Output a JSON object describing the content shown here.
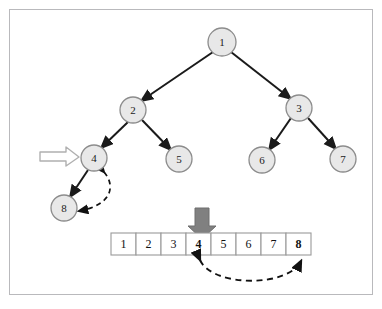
{
  "figure": {
    "background_color": "#ffffff",
    "frame_color": "#b9b9bc"
  },
  "colors": {
    "node_fill": "#e8e8e8",
    "node_stroke": "#8c8c8c",
    "node_text": "#1b1b1b",
    "edge": "#1a1a1a",
    "dashed_arrow": "#111111",
    "block_arrow_fill": "#808080",
    "block_arrow_stroke": "#6e6e6e",
    "hollow_arrow_fill": "#ffffff",
    "hollow_arrow_stroke": "#b0b0b0",
    "cell_border": "#9a9a9a",
    "cell_fill": "#ffffff"
  },
  "tree": {
    "name": "binary-tree",
    "nodes": [
      {
        "id": "n1",
        "label": "1",
        "cx": 222,
        "cy": 42,
        "r": 14
      },
      {
        "id": "n2",
        "label": "2",
        "cx": 133,
        "cy": 110,
        "r": 13
      },
      {
        "id": "n3",
        "label": "3",
        "cx": 299,
        "cy": 108,
        "r": 13
      },
      {
        "id": "n4",
        "label": "4",
        "cx": 94,
        "cy": 158,
        "r": 13
      },
      {
        "id": "n5",
        "label": "5",
        "cx": 179,
        "cy": 159,
        "r": 13
      },
      {
        "id": "n6",
        "label": "6",
        "cx": 262,
        "cy": 160,
        "r": 13
      },
      {
        "id": "n7",
        "label": "7",
        "cx": 343,
        "cy": 159,
        "r": 13
      },
      {
        "id": "n8",
        "label": "8",
        "cx": 64,
        "cy": 208,
        "r": 13
      }
    ],
    "edges": [
      {
        "from": "n1",
        "to": "n2"
      },
      {
        "from": "n1",
        "to": "n3"
      },
      {
        "from": "n2",
        "to": "n4"
      },
      {
        "from": "n2",
        "to": "n5"
      },
      {
        "from": "n3",
        "to": "n6"
      },
      {
        "from": "n3",
        "to": "n7"
      },
      {
        "from": "n4",
        "to": "n8"
      }
    ]
  },
  "array": {
    "name": "array-row",
    "x": 111,
    "y": 233,
    "cell_width": 25,
    "cell_height": 22,
    "cells": [
      {
        "value": "1",
        "bold": false
      },
      {
        "value": "2",
        "bold": false
      },
      {
        "value": "3",
        "bold": false
      },
      {
        "value": "4",
        "bold": true
      },
      {
        "value": "5",
        "bold": false
      },
      {
        "value": "6",
        "bold": false
      },
      {
        "value": "7",
        "bold": false
      },
      {
        "value": "8",
        "bold": true
      }
    ]
  },
  "annotations": {
    "hollow_arrow": {
      "name": "hollow-pointer-arrow",
      "description": "hollow right-pointing arrow marking node 4",
      "points_to": "4"
    },
    "block_arrow": {
      "name": "block-down-arrow",
      "description": "solid gray down arrow marking array index of value 4",
      "points_to": "4"
    },
    "tree_swap_arrow": {
      "name": "tree-swap-dashed-arrow",
      "description": "dashed double-headed arc between node 4 and node 8",
      "from": "4",
      "to": "8"
    },
    "array_swap_arrow": {
      "name": "array-swap-dashed-arrow",
      "description": "dashed double-headed arc between array cell 4 and array cell 8",
      "from": "4",
      "to": "8"
    }
  }
}
